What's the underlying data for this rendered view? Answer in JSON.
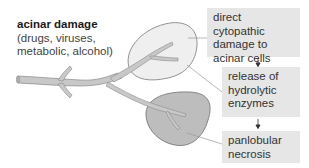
{
  "title": {
    "heading": "acinar damage",
    "causes_line1": "(drugs, viruses,",
    "causes_line2": "metabolic, alcohol)"
  },
  "steps": [
    {
      "line1": "direct cytopathic",
      "line2": "damage to",
      "line3": "acinar cells"
    },
    {
      "line1": "release of",
      "line2": "hydrolytic",
      "line3": "enzymes"
    },
    {
      "line1": "panlobular",
      "line2": "necrosis"
    }
  ],
  "colors": {
    "box_fill": "#e6e6e6",
    "duct_fill": "#c8c8c8",
    "healthy_lobule_fill": "#efefef",
    "necrotic_lobule_fill": "#bdbdbd",
    "outline": "#7a7a7a",
    "leader_line": "#999999",
    "arrow": "#333333"
  }
}
